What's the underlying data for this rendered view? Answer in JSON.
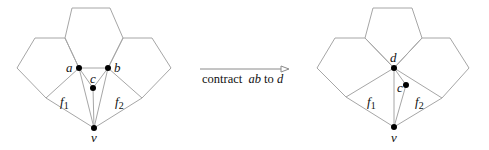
{
  "figure": {
    "before": {
      "vertices": {
        "a": {
          "label": "a",
          "x": 79,
          "y": 68
        },
        "b": {
          "label": "b",
          "x": 108,
          "y": 68
        },
        "c": {
          "label": "c",
          "x": 93,
          "y": 88
        },
        "v": {
          "label": "v",
          "x": 94,
          "y": 128
        }
      },
      "faces": {
        "f1": {
          "label": "f",
          "subscript": "1"
        },
        "f2": {
          "label": "f",
          "subscript": "2"
        }
      }
    },
    "operation": {
      "caption_prefix": "contract",
      "caption_edge": "ab",
      "caption_mid": "to",
      "caption_target": "d"
    },
    "after": {
      "vertices": {
        "d": {
          "label": "d",
          "x": 394,
          "y": 68
        },
        "c": {
          "label": "c",
          "x": 406,
          "y": 85
        },
        "v": {
          "label": "v",
          "x": 394,
          "y": 127
        }
      },
      "faces": {
        "f1": {
          "label": "f",
          "subscript": "1"
        },
        "f2": {
          "label": "f",
          "subscript": "2"
        }
      }
    },
    "colors": {
      "edge": "#a6a6a6",
      "vertex": "#000000",
      "arrow": "#8a8a8a"
    }
  }
}
